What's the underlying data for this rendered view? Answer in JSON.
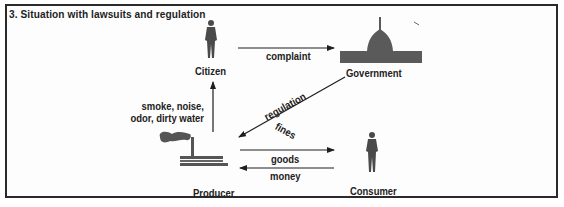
{
  "figure": {
    "title": "3.  Situation with lawsuits and regulation"
  },
  "nodes": {
    "citizen": {
      "label": "Citizen",
      "icon": "person-icon"
    },
    "government": {
      "label": "Government",
      "icon": "capitol-building-icon"
    },
    "producer": {
      "label": "Producer",
      "icon": "factory-smokestack-icon"
    },
    "consumer": {
      "label": "Consumer",
      "icon": "person-icon"
    }
  },
  "edges": [
    {
      "from": "citizen",
      "to": "government",
      "label": "complaint"
    },
    {
      "from": "producer",
      "to": "citizen",
      "label_lines": [
        "smoke, noise,",
        "odor, dirty water"
      ]
    },
    {
      "from": "government",
      "to": "producer",
      "label_lines": [
        "regulation",
        "fines"
      ]
    },
    {
      "from": "producer",
      "to": "consumer",
      "label": "goods"
    },
    {
      "from": "consumer",
      "to": "producer",
      "label": "money"
    }
  ],
  "colors": {
    "silhouette": "#4a4a4a",
    "line": "#1e1e1e",
    "frame": "#2a2a2a"
  }
}
